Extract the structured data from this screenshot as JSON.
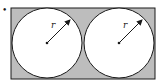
{
  "diagram": {
    "colors": {
      "fill": "#bdbdbd",
      "stroke": "#1a1a1a",
      "circle_fill": "#ffffff"
    },
    "rectangle": {
      "x": 11,
      "y": 8,
      "width": 144,
      "height": 71
    },
    "circles": [
      {
        "cx": 47,
        "cy": 43,
        "r": 35,
        "label": "r"
      },
      {
        "cx": 119,
        "cy": 43,
        "r": 35,
        "label": "r"
      }
    ],
    "bullet": "•"
  }
}
